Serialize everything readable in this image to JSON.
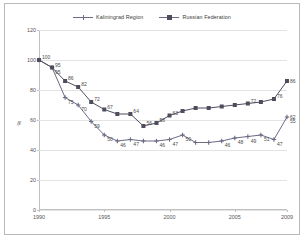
{
  "chart_data": {
    "type": "line",
    "title": "",
    "xlabel": "",
    "ylabel": "%",
    "xlim": [
      1990,
      2009
    ],
    "ylim": [
      0,
      120
    ],
    "ytick_values": [
      0,
      20,
      40,
      60,
      80,
      100,
      120
    ],
    "ytick_labels": [
      "0",
      "20",
      "40",
      "60",
      "80",
      "100",
      "120"
    ],
    "xtick_values": [
      1990,
      1995,
      2000,
      2005,
      2009
    ],
    "xtick_labels": [
      "1990",
      "1995",
      "2000",
      "2005",
      "2009"
    ],
    "grid": true,
    "legend_position": "top-center",
    "x": [
      1990,
      1991,
      1992,
      1993,
      1994,
      1995,
      1996,
      1997,
      1998,
      1999,
      2000,
      2001,
      2002,
      2003,
      2004,
      2005,
      2006,
      2007,
      2008,
      2009
    ],
    "series": [
      {
        "name": "Kaliningrad Region",
        "color": "#6b6b85",
        "marker": "cross",
        "values": [
          100,
          95,
          75,
          70,
          59,
          50,
          46,
          47,
          46,
          46,
          47,
          50,
          45,
          45,
          46,
          48,
          49,
          50,
          47,
          55
        ],
        "labels": [
          "",
          "95",
          "75",
          "70",
          "59",
          "50",
          "46",
          "47",
          "",
          "46",
          "47",
          "50",
          "",
          "",
          "46",
          "48",
          "49",
          "51",
          "47",
          "55"
        ],
        "endpoint_label": "62",
        "endpoint_value": 62
      },
      {
        "name": "Russian Federation",
        "color": "#4d4d5e",
        "marker": "square",
        "values": [
          100,
          95,
          86,
          82,
          72,
          67,
          64,
          64,
          56,
          58,
          63,
          66,
          68,
          68,
          69,
          70,
          71,
          72,
          74,
          84
        ],
        "labels": [
          "100",
          "95",
          "86",
          "82",
          "72",
          "67",
          "",
          "64",
          "56",
          "58",
          "63",
          "",
          "",
          "",
          "",
          "",
          "72",
          "",
          "76",
          ""
        ],
        "endpoint_label": "86",
        "endpoint_value": 86
      }
    ]
  },
  "legend": {
    "items": [
      {
        "label": "Kaliningrad Region",
        "marker": "cross"
      },
      {
        "label": "Russian Federation",
        "marker": "square"
      }
    ]
  },
  "axis": {
    "y_title": "%"
  }
}
